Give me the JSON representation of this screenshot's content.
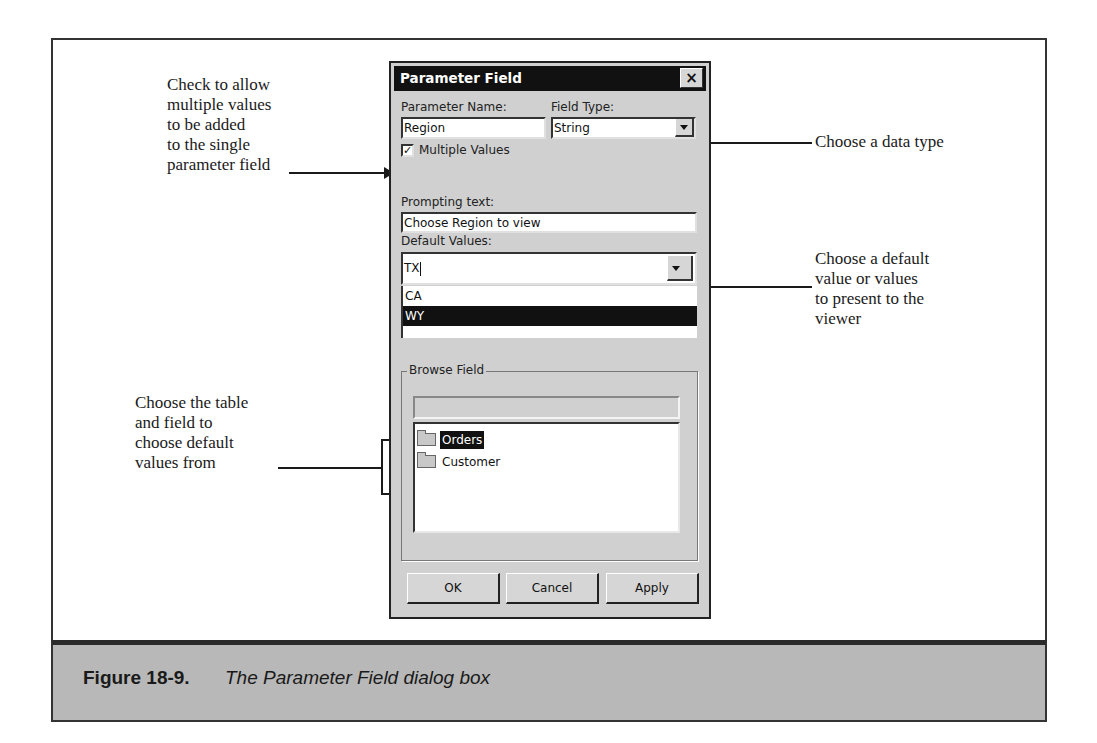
{
  "figure": {
    "number": "Figure 18-9.",
    "caption": "The Parameter Field dialog box"
  },
  "callouts": {
    "multiple_values": [
      "Check to allow",
      "multiple values",
      "to be added",
      "to the single",
      "parameter field"
    ],
    "data_type": [
      "Choose a data type"
    ],
    "default_value": [
      "Choose a default",
      "value or values",
      "to present to the",
      "viewer"
    ],
    "browse_field": [
      "Choose the table",
      "and field to",
      "choose default",
      "values from"
    ]
  },
  "dialog": {
    "title": "Parameter Field",
    "close_icon": "×",
    "parameter_name_label": "Parameter Name:",
    "parameter_name_value": "Region",
    "field_type_label": "Field Type:",
    "field_type_value": "String",
    "multiple_values_label": "Multiple Values",
    "multiple_values_checked": true,
    "check_mark": "✓",
    "prompting_text_label": "Prompting text:",
    "prompting_text_value": "Choose Region to view",
    "default_values_label": "Default Values:",
    "default_values_input": "TX",
    "default_values_list": [
      {
        "label": "CA",
        "selected": false
      },
      {
        "label": "WY",
        "selected": true
      }
    ],
    "browse_field": {
      "title": "Browse Field",
      "field_value": "",
      "tree": [
        {
          "label": "Orders",
          "icon": "folder-icon",
          "selected": true
        },
        {
          "label": "Customer",
          "icon": "folder-icon",
          "selected": false
        }
      ]
    },
    "buttons": {
      "ok": "OK",
      "cancel": "Cancel",
      "apply": "Apply"
    }
  }
}
